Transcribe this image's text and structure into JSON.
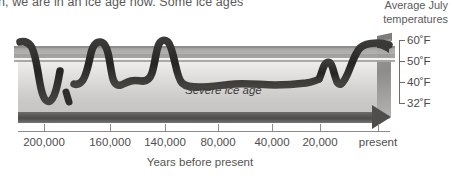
{
  "caption": {
    "text": "n, we are in an ice age now. Some ice ages"
  },
  "right_header": {
    "line1": "Average July",
    "line2": "temperatures"
  },
  "annotation": {
    "severe_ice_age": "Severe ice age"
  },
  "x_axis": {
    "title": "Years before present",
    "ticks": [
      {
        "label": "200,000",
        "x": 44
      },
      {
        "label": "160,000",
        "x": 110
      },
      {
        "label": "140,000",
        "x": 165
      },
      {
        "label": "80,000",
        "x": 218
      },
      {
        "label": "40,000",
        "x": 272
      },
      {
        "label": "20,000",
        "x": 320
      },
      {
        "label": "present",
        "x": 378
      }
    ]
  },
  "y_axis": {
    "ticks": [
      {
        "label": "60˚F",
        "y": 40
      },
      {
        "label": "50˚F",
        "y": 61
      },
      {
        "label": "40˚F",
        "y": 82
      },
      {
        "label": "32˚F",
        "y": 103
      }
    ]
  },
  "colors": {
    "curve": "#2e2d2c",
    "band": "#a8a7a5",
    "slab_top": "#ffffff",
    "slab_bottom": "#c3c2c0",
    "arrow": "#4f4e4c",
    "text": "#55544f"
  },
  "chart_data": {
    "type": "line",
    "xlabel": "Years before present",
    "ylabel": "Average July temperatures",
    "xlim": [
      200000,
      0
    ],
    "ylim": [
      32,
      60
    ],
    "grid": false,
    "legend": null,
    "xtick_labels": [
      "200,000",
      "160,000",
      "140,000",
      "80,000",
      "40,000",
      "20,000",
      "present"
    ],
    "ytick_labels": [
      "60˚F",
      "50˚F",
      "40˚F",
      "32˚F"
    ],
    "annotations": [
      {
        "text": "Severe ice age",
        "x": 60000,
        "y": 38
      }
    ],
    "reference_band": {
      "from": 50,
      "to": 60,
      "label": "interglacial warm band"
    },
    "series": [
      {
        "name": "Average July temperature",
        "x": [
          200000,
          196000,
          192000,
          188000,
          184000,
          180000,
          176000,
          172000,
          168000,
          164000,
          160000,
          156000,
          152000,
          148000,
          144000,
          140000,
          132000,
          124000,
          116000,
          108000,
          100000,
          92000,
          84000,
          76000,
          68000,
          60000,
          52000,
          44000,
          36000,
          28000,
          22000,
          18000,
          15000,
          12000,
          9000,
          6000,
          3000,
          0
        ],
        "y": [
          60,
          59,
          55,
          48,
          42,
          38,
          37,
          38,
          40,
          47,
          56,
          59,
          57,
          50,
          45,
          44,
          44,
          50,
          58,
          59,
          53,
          45,
          43,
          43,
          43,
          42,
          43,
          42,
          43,
          42,
          44,
          51,
          44,
          40,
          52,
          59,
          58,
          59
        ]
      }
    ]
  }
}
